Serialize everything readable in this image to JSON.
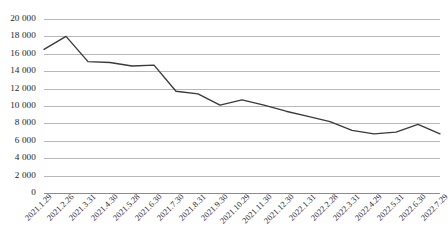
{
  "chart_data": {
    "type": "line",
    "title": "",
    "subtitle": "",
    "xlabel": "",
    "ylabel": "",
    "legend": [],
    "legend_position": "none",
    "grid": true,
    "grid_axis": "y",
    "ylim": [
      0,
      20000
    ],
    "y_tick_step": 2000,
    "y_ticks": [
      "20 000",
      "18 000",
      "16 000",
      "14 000",
      "12 000",
      "10 000",
      "8 000",
      "6 000",
      "4 000",
      "2 000",
      "0"
    ],
    "y_tick_values": [
      20000,
      18000,
      16000,
      14000,
      12000,
      10000,
      8000,
      6000,
      4000,
      2000,
      0
    ],
    "categories": [
      "2021.1.29",
      "2021.2.26",
      "2021.3.31",
      "2021.4.30",
      "2021.5.28",
      "2021.6.30",
      "2021.7.30",
      "2021.8.31",
      "2021.9.30",
      "2021.10.29",
      "2021.11.30",
      "2021.12.30",
      "2022.1.31",
      "2022.2.28",
      "2022.3.31",
      "2022.4.29",
      "2022.5.31",
      "2022.6.30",
      "2022.7.29"
    ],
    "values": [
      16500,
      18000,
      15100,
      15000,
      14600,
      14700,
      11700,
      11400,
      10100,
      10700,
      10100,
      9400,
      8800,
      8200,
      7200,
      6800,
      7000,
      7900,
      6800
    ],
    "series": [
      {
        "name": "",
        "color": "#3a3a3a",
        "values": [
          16500,
          18000,
          15100,
          15000,
          14600,
          14700,
          11700,
          11400,
          10100,
          10700,
          10100,
          9400,
          8800,
          8200,
          7200,
          6800,
          7000,
          7900,
          6800
        ]
      }
    ],
    "colors": {
      "line": "#3a3a3a",
      "gridline": "#a6a6a6",
      "axis": "#808080",
      "text": "#262626",
      "background": "#ffffff"
    }
  }
}
